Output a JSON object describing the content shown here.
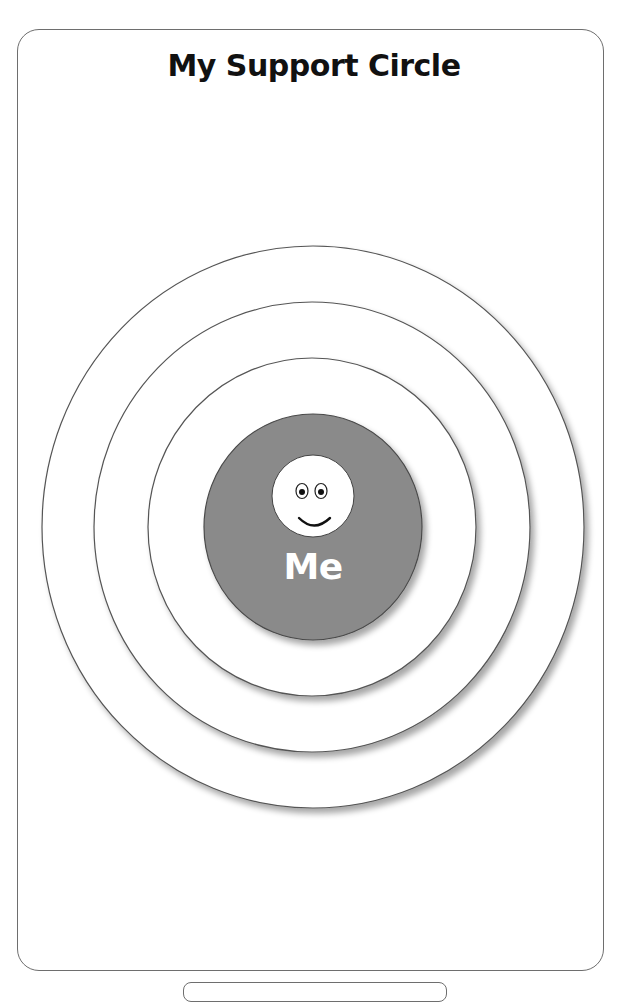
{
  "worksheet": {
    "title": "My Support Circle",
    "center_label": "Me",
    "center_icon": "smiley-face-icon"
  },
  "rings": [
    {
      "name": "outer-ring",
      "cx": 313,
      "cy": 527,
      "rx": 271,
      "ry": 281,
      "fill": "#ffffff"
    },
    {
      "name": "middle-ring",
      "cx": 313,
      "cy": 527,
      "rx": 218,
      "ry": 225,
      "fill": "#ffffff"
    },
    {
      "name": "inner-ring",
      "cx": 313,
      "cy": 527,
      "rx": 164,
      "ry": 169,
      "fill": "#ffffff"
    },
    {
      "name": "center-circle",
      "cx": 313,
      "cy": 527,
      "rx": 109,
      "ry": 113,
      "fill": "#8a8a8a"
    }
  ],
  "colors": {
    "center_fill": "#8a8a8a",
    "ring_stroke": "#555555",
    "card_border": "#6e6e6e",
    "title_color": "#111111",
    "label_color": "#ffffff"
  }
}
